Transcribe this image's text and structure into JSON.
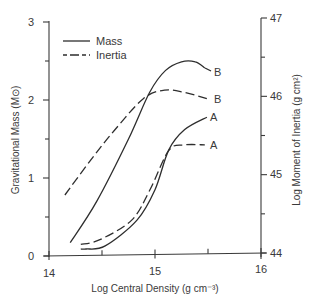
{
  "chart_data": {
    "type": "line",
    "title": "",
    "xlabel": "Log Central Density (g cm⁻³)",
    "ylabel": "Gravitational Mass (M⊙)",
    "y2label": "Log Moment of Inertia (g cm²)",
    "xlim": [
      14,
      16
    ],
    "ylim": [
      0,
      3
    ],
    "y2lim": [
      44,
      47
    ],
    "xticks": [
      "14",
      "15",
      "16"
    ],
    "yticks": [
      "0",
      "1",
      "2",
      "3"
    ],
    "y2ticks": [
      "44",
      "45",
      "46",
      "47"
    ],
    "grid": false,
    "legend": {
      "position": "upper-left",
      "entries": [
        {
          "label": "Mass",
          "style": "solid"
        },
        {
          "label": "Inertia",
          "style": "dashed"
        }
      ]
    },
    "series": [
      {
        "name": "Mass",
        "model": "B",
        "style": "solid",
        "axis": "left",
        "x": [
          14.2,
          14.45,
          14.75,
          14.95,
          15.1,
          15.25,
          15.38,
          15.47
        ],
        "values": [
          0.17,
          0.7,
          1.5,
          2.1,
          2.38,
          2.49,
          2.49,
          2.41
        ]
      },
      {
        "name": "Inertia",
        "model": "B",
        "style": "dashed",
        "axis": "right",
        "x": [
          14.15,
          14.39,
          14.62,
          14.89,
          15.09,
          15.28,
          15.49
        ],
        "values": [
          44.74,
          45.18,
          45.57,
          45.97,
          46.08,
          46.05,
          45.97
        ]
      },
      {
        "name": "Mass",
        "model": "A",
        "style": "solid",
        "axis": "left",
        "x": [
          14.3,
          14.35,
          14.53,
          14.83,
          15.0,
          15.13,
          15.28,
          15.49
        ],
        "values": [
          0.09,
          0.09,
          0.13,
          0.46,
          0.85,
          1.36,
          1.62,
          1.78
        ]
      },
      {
        "name": "Inertia",
        "model": "A",
        "style": "dashed",
        "axis": "right",
        "x": [
          14.3,
          14.48,
          14.78,
          14.95,
          15.13,
          15.28,
          15.47
        ],
        "values": [
          44.11,
          44.17,
          44.42,
          44.8,
          45.31,
          45.38,
          45.38
        ]
      }
    ],
    "annotations": [
      {
        "text": "B",
        "series": "Mass B"
      },
      {
        "text": "B",
        "series": "Inertia B"
      },
      {
        "text": "A",
        "series": "Mass A"
      },
      {
        "text": "A",
        "series": "Inertia A"
      }
    ]
  }
}
